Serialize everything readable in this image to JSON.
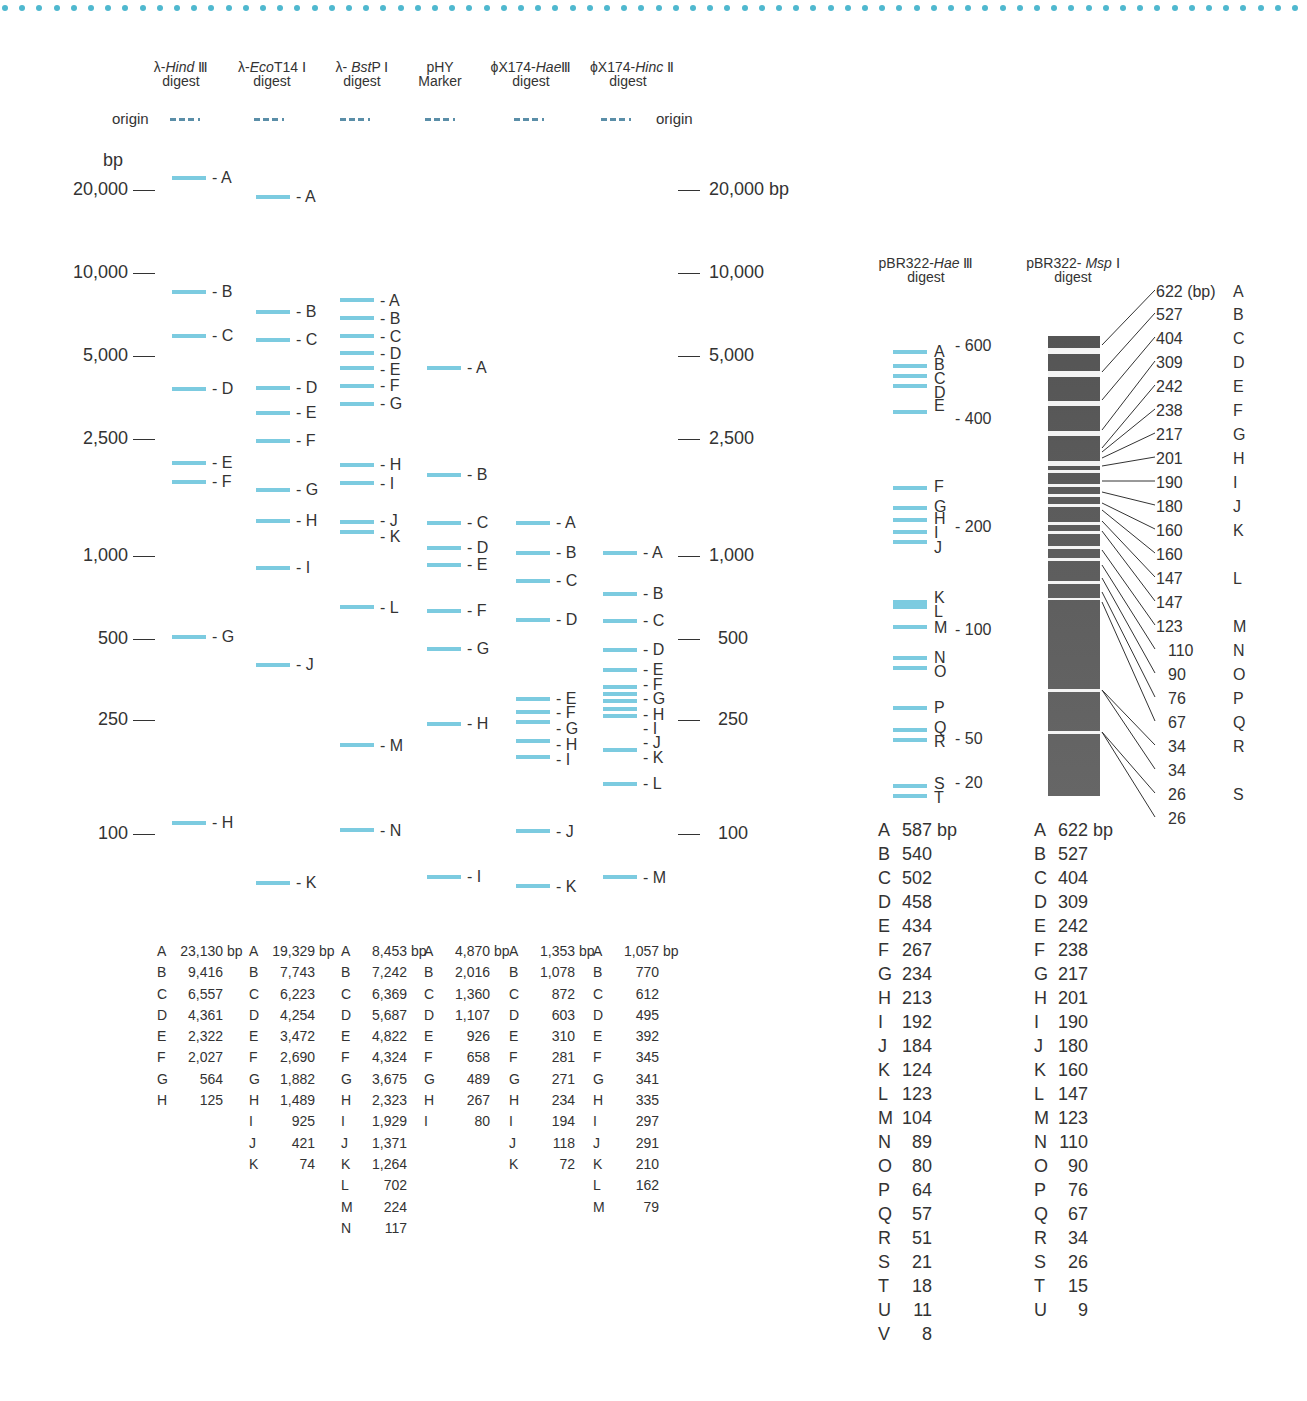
{
  "lanes": [
    {
      "id": "hind3",
      "title_prefix": "λ-",
      "title_italic": "Hind",
      "title_suffix": " Ⅲ",
      "subtitle": "digest",
      "bands": [
        [
          "A",
          "23,130 bp"
        ],
        [
          "B",
          "9,416"
        ],
        [
          "C",
          "6,557"
        ],
        [
          "D",
          "4,361"
        ],
        [
          "E",
          "2,322"
        ],
        [
          "F",
          "2,027"
        ],
        [
          "G",
          "564"
        ],
        [
          "H",
          "125"
        ]
      ]
    },
    {
      "id": "ecot14",
      "title_prefix": "λ-",
      "title_italic": "Eco",
      "title_suffix": "T14 Ⅰ",
      "subtitle": "digest",
      "bands": [
        [
          "A",
          "19,329 bp"
        ],
        [
          "B",
          "7,743"
        ],
        [
          "C",
          "6,223"
        ],
        [
          "D",
          "4,254"
        ],
        [
          "E",
          "3,472"
        ],
        [
          "F",
          "2,690"
        ],
        [
          "G",
          "1,882"
        ],
        [
          "H",
          "1,489"
        ],
        [
          "I",
          "925"
        ],
        [
          "J",
          "421"
        ],
        [
          "K",
          "74"
        ]
      ]
    },
    {
      "id": "bstp1",
      "title_prefix": "λ- ",
      "title_italic": "Bst",
      "title_suffix": "P Ⅰ",
      "subtitle": "digest",
      "bands": [
        [
          "A",
          "8,453 bp"
        ],
        [
          "B",
          "7,242"
        ],
        [
          "C",
          "6,369"
        ],
        [
          "D",
          "5,687"
        ],
        [
          "E",
          "4,822"
        ],
        [
          "F",
          "4,324"
        ],
        [
          "G",
          "3,675"
        ],
        [
          "H",
          "2,323"
        ],
        [
          "I",
          "1,929"
        ],
        [
          "J",
          "1,371"
        ],
        [
          "K",
          "1,264"
        ],
        [
          "L",
          "702"
        ],
        [
          "M",
          "224"
        ],
        [
          "N",
          "117"
        ]
      ]
    },
    {
      "id": "phy",
      "title_prefix": "pHY",
      "title_italic": "",
      "title_suffix": "",
      "subtitle": "Marker",
      "bands": [
        [
          "A",
          "4,870 bp"
        ],
        [
          "B",
          "2,016"
        ],
        [
          "C",
          "1,360"
        ],
        [
          "D",
          "1,107"
        ],
        [
          "E",
          "926"
        ],
        [
          "F",
          "658"
        ],
        [
          "G",
          "489"
        ],
        [
          "H",
          "267"
        ],
        [
          "I",
          "80"
        ]
      ]
    },
    {
      "id": "phix_hae3",
      "title_prefix": "ϕX174-",
      "title_italic": "Hae",
      "title_suffix": "Ⅲ",
      "subtitle": "digest",
      "bands": [
        [
          "A",
          "1,353 bp"
        ],
        [
          "B",
          "1,078"
        ],
        [
          "C",
          "872"
        ],
        [
          "D",
          "603"
        ],
        [
          "E",
          "310"
        ],
        [
          "F",
          "281"
        ],
        [
          "G",
          "271"
        ],
        [
          "H",
          "234"
        ],
        [
          "I",
          "194"
        ],
        [
          "J",
          "118"
        ],
        [
          "K",
          "72"
        ]
      ]
    },
    {
      "id": "phix_hinc2",
      "title_prefix": "ϕX174-",
      "title_italic": "Hinc",
      "title_suffix": " Ⅱ",
      "subtitle": "digest",
      "bands": [
        [
          "A",
          "1,057 bp"
        ],
        [
          "B",
          "770"
        ],
        [
          "C",
          "612"
        ],
        [
          "D",
          "495"
        ],
        [
          "E",
          "392"
        ],
        [
          "F",
          "345"
        ],
        [
          "G",
          "341"
        ],
        [
          "H",
          "335"
        ],
        [
          "I",
          "297"
        ],
        [
          "J",
          "291"
        ],
        [
          "K",
          "210"
        ],
        [
          "L",
          "162"
        ],
        [
          "M",
          "79"
        ]
      ]
    }
  ],
  "origin_label_left": "origin",
  "origin_label_right": "origin",
  "axis_unit": "bp",
  "axis_left": [
    "20,000",
    "10,000",
    "5,000",
    "2,500",
    "1,000",
    "500",
    "250",
    "100"
  ],
  "axis_right": [
    "20,000 bp",
    "10,000",
    "5,000",
    "2,500",
    "1,000",
    "500",
    "250",
    "100"
  ],
  "pbr_hae3": {
    "title_prefix": "pBR322-",
    "title_italic": "Hae",
    "title_suffix": " Ⅲ",
    "subtitle": "digest",
    "markers": [
      "600",
      "400",
      "200",
      "100",
      "50",
      "20"
    ],
    "bands": [
      [
        "A",
        "587 bp"
      ],
      [
        "B",
        "540"
      ],
      [
        "C",
        "502"
      ],
      [
        "D",
        "458"
      ],
      [
        "E",
        "434"
      ],
      [
        "F",
        "267"
      ],
      [
        "G",
        "234"
      ],
      [
        "H",
        "213"
      ],
      [
        "I",
        "192"
      ],
      [
        "J",
        "184"
      ],
      [
        "K",
        "124"
      ],
      [
        "L",
        "123"
      ],
      [
        "M",
        "104"
      ],
      [
        "N",
        "89"
      ],
      [
        "O",
        "80"
      ],
      [
        "P",
        "64"
      ],
      [
        "Q",
        "57"
      ],
      [
        "R",
        "51"
      ],
      [
        "S",
        "21"
      ],
      [
        "T",
        "18"
      ],
      [
        "U",
        "11"
      ],
      [
        "V",
        "8"
      ]
    ]
  },
  "pbr_msp1": {
    "title_prefix": "pBR322- ",
    "title_italic": "Msp",
    "title_suffix": " Ⅰ",
    "subtitle": "digest",
    "gel_labels": [
      "622 (bp)",
      "527",
      "404",
      "309",
      "242",
      "238",
      "217",
      "201",
      "190",
      "180",
      "160",
      "160",
      "147",
      "147",
      "123",
      "110",
      "90",
      "76",
      "67",
      "34",
      "34",
      "26",
      "26"
    ],
    "letters": [
      "A",
      "B",
      "C",
      "D",
      "E",
      "F",
      "G",
      "H",
      "I",
      "J",
      "K",
      "",
      "L",
      "",
      "M",
      "N",
      "O",
      "P",
      "Q",
      "R",
      "",
      "S",
      ""
    ],
    "bands": [
      [
        "A",
        "622 bp"
      ],
      [
        "B",
        "527"
      ],
      [
        "C",
        "404"
      ],
      [
        "D",
        "309"
      ],
      [
        "E",
        "242"
      ],
      [
        "F",
        "238"
      ],
      [
        "G",
        "217"
      ],
      [
        "H",
        "201"
      ],
      [
        "I",
        "190"
      ],
      [
        "J",
        "180"
      ],
      [
        "K",
        "160"
      ],
      [
        "L",
        "147"
      ],
      [
        "M",
        "123"
      ],
      [
        "N",
        "110"
      ],
      [
        "O",
        "90"
      ],
      [
        "P",
        "76"
      ],
      [
        "Q",
        "67"
      ],
      [
        "R",
        "34"
      ],
      [
        "S",
        "26"
      ],
      [
        "T",
        "15"
      ],
      [
        "U",
        "9"
      ]
    ]
  },
  "colors": {
    "band": "#7ccbe0",
    "dots": "#4fb8cf",
    "origin": "#5a8ea8",
    "text": "#333333"
  }
}
